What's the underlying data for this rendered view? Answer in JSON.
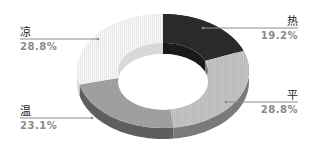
{
  "chart_data": {
    "type": "pie",
    "variant": "3d-donut",
    "title": "",
    "categories": [
      "热",
      "平",
      "温",
      "凉"
    ],
    "values": [
      19.2,
      28.8,
      23.1,
      28.8
    ],
    "unit": "%",
    "labels": [
      {
        "name": "热",
        "pct": "19.2%"
      },
      {
        "name": "平",
        "pct": "28.8%"
      },
      {
        "name": "温",
        "pct": "23.1%"
      },
      {
        "name": "凉",
        "pct": "28.8%"
      }
    ],
    "colors": [
      "#2b2b2b",
      "#c4c4c4",
      "#a3a3a3",
      "#f6f6f6"
    ],
    "side_colors": [
      "#1a1a1a",
      "#7a7a7a",
      "#5e5e5e",
      "#d8d8d8"
    ],
    "legend": "none",
    "start_angle_deg": 0,
    "direction": "clockwise"
  }
}
